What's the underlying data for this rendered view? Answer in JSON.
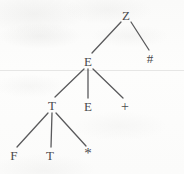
{
  "figure": {
    "kind": "parse-tree",
    "background_color": "#fbfbfa",
    "ink_color": "#4a4a4c",
    "edge_color": "#5a5a5c",
    "width": 184,
    "height": 174
  },
  "nodes": [
    {
      "id": "n0",
      "label": "Z",
      "x": 126,
      "y": 15,
      "role": "root",
      "kind": "nonterminal"
    },
    {
      "id": "n1",
      "label": "E",
      "x": 88,
      "y": 61,
      "role": "internal",
      "kind": "nonterminal"
    },
    {
      "id": "n2",
      "label": "#",
      "x": 150,
      "y": 58,
      "role": "leaf",
      "kind": "terminal"
    },
    {
      "id": "n3",
      "label": "T",
      "x": 52,
      "y": 105,
      "role": "internal",
      "kind": "nonterminal"
    },
    {
      "id": "n4",
      "label": "E",
      "x": 88,
      "y": 106,
      "role": "leaf",
      "kind": "nonterminal"
    },
    {
      "id": "n5",
      "label": "+",
      "x": 125,
      "y": 107,
      "role": "leaf",
      "kind": "terminal"
    },
    {
      "id": "n6",
      "label": "F",
      "x": 14,
      "y": 155,
      "role": "leaf",
      "kind": "nonterminal"
    },
    {
      "id": "n7",
      "label": "T",
      "x": 50,
      "y": 155,
      "role": "leaf",
      "kind": "nonterminal"
    },
    {
      "id": "n8",
      "label": "*",
      "x": 88,
      "y": 153,
      "role": "leaf",
      "kind": "terminal"
    }
  ],
  "edges": [
    {
      "id": "e0",
      "from": "n0",
      "to": "n1",
      "x1": 121,
      "y1": 22,
      "x2": 92,
      "y2": 53
    },
    {
      "id": "e1",
      "from": "n0",
      "to": "n2",
      "x1": 131,
      "y1": 22,
      "x2": 149,
      "y2": 50
    },
    {
      "id": "e2",
      "from": "n1",
      "to": "n3",
      "x1": 84,
      "y1": 69,
      "x2": 55,
      "y2": 97
    },
    {
      "id": "e3",
      "from": "n1",
      "to": "n4",
      "x1": 88,
      "y1": 69,
      "x2": 88,
      "y2": 98
    },
    {
      "id": "e4",
      "from": "n1",
      "to": "n5",
      "x1": 93,
      "y1": 69,
      "x2": 123,
      "y2": 98
    },
    {
      "id": "e5",
      "from": "n3",
      "to": "n6",
      "x1": 48,
      "y1": 113,
      "x2": 17,
      "y2": 147
    },
    {
      "id": "e6",
      "from": "n3",
      "to": "n7",
      "x1": 52,
      "y1": 113,
      "x2": 51,
      "y2": 147
    },
    {
      "id": "e7",
      "from": "n3",
      "to": "n8",
      "x1": 56,
      "y1": 113,
      "x2": 86,
      "y2": 146
    }
  ],
  "artifacts": {
    "scan_rule_y": 70
  }
}
